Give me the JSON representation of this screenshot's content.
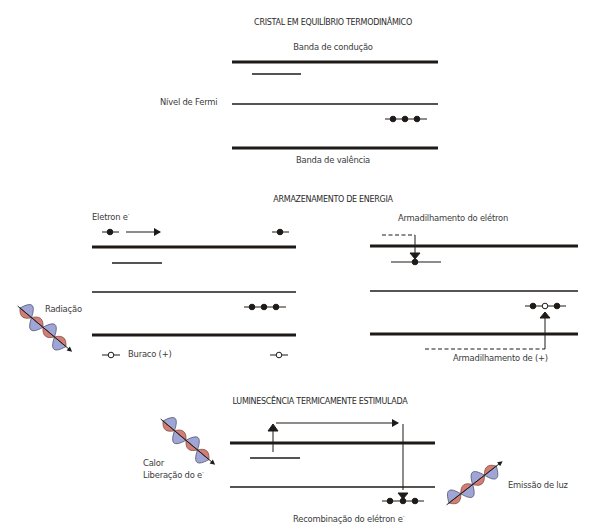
{
  "colors": {
    "line": "#1e1a18",
    "text": "#3a3a3a",
    "wave_blue": "#9fa6d6",
    "wave_red": "#c9675e",
    "background": "#ffffff"
  },
  "panel_equilibrium": {
    "title": "CRISTAL EM EQUILÍBRIO TERMODINÂMICO",
    "conduction_band_label": "Banda de condução",
    "fermi_level_label": "Nível de Fermi",
    "valence_band_label": "Banda de valência"
  },
  "panel_storage": {
    "title": "ARMAZENAMENTO DE ENERGIA",
    "electron_label": "Eletron e",
    "electron_superscript": "-",
    "radiation_label": "Radiação",
    "hole_label": "Buraco (+)",
    "electron_trapping_label": "Armadilhamento do elétron",
    "hole_trapping_label": "Armadilhamento de (+)"
  },
  "panel_luminescence": {
    "title": "LUMINESCÊNCIA TERMICAMENTE ESTIMULADA",
    "heat_label": "Calor",
    "electron_release_label": "Liberação do e",
    "release_superscript": "-",
    "recombination_label": "Recombinação do elétron e",
    "recombination_superscript": "-",
    "light_emission_label": "Emissão de luz"
  }
}
